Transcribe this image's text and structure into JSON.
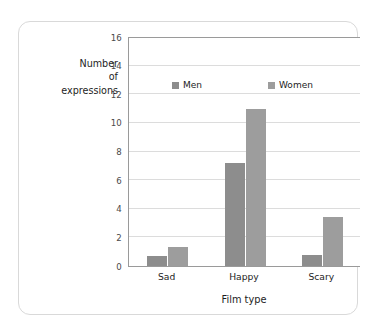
{
  "chart_data": {
    "type": "bar",
    "title": "",
    "subtitle": "",
    "xlabel": "Film type",
    "ylabel": "Number of expressions",
    "ylabel_lines": [
      "Number",
      "of",
      "expressions"
    ],
    "categories": [
      "Sad",
      "Happy",
      "Scary"
    ],
    "series": [
      {
        "name": "Men",
        "color": "#8d8d8d",
        "values": [
          0.7,
          7.2,
          0.8
        ]
      },
      {
        "name": "Women",
        "color": "#9d9d9d",
        "values": [
          1.3,
          11.0,
          3.4
        ]
      }
    ],
    "ylim": [
      0,
      16
    ],
    "ytick_step": 2,
    "ytick_labels": [
      "0",
      "2",
      "4",
      "6",
      "8",
      "10",
      "12",
      "14",
      "16"
    ],
    "grid": "horizontal",
    "legend_position": "inside-top-center",
    "axis_color": "#9a9a9a",
    "gridline_color": "#dcdcdc",
    "card_border_color": "#d9d9d9",
    "background": "#ffffff"
  }
}
